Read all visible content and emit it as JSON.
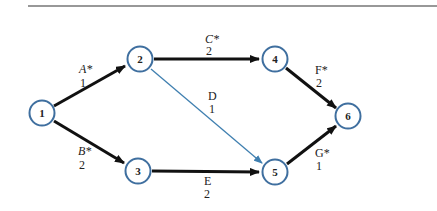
{
  "diagram": {
    "type": "activity-on-arc network",
    "colors": {
      "node_stroke": "#3f6f9f",
      "critical_arc": "#111111",
      "noncritical_arc": "#3f7fb0",
      "rule_line": "#333333"
    },
    "nodes": [
      {
        "id": "1",
        "label": "1"
      },
      {
        "id": "2",
        "label": "2"
      },
      {
        "id": "3",
        "label": "3"
      },
      {
        "id": "4",
        "label": "4"
      },
      {
        "id": "5",
        "label": "5"
      },
      {
        "id": "6",
        "label": "6"
      }
    ],
    "arcs": [
      {
        "activity": "A*",
        "duration": "1",
        "from": "1",
        "to": "2",
        "critical": true
      },
      {
        "activity": "B*",
        "duration": "2",
        "from": "1",
        "to": "3",
        "critical": true
      },
      {
        "activity": "C*",
        "duration": "2",
        "from": "2",
        "to": "4",
        "critical": true
      },
      {
        "activity": "D",
        "duration": "1",
        "from": "2",
        "to": "5",
        "critical": false
      },
      {
        "activity": "E",
        "duration": "2",
        "from": "3",
        "to": "5",
        "critical": true
      },
      {
        "activity": "F*",
        "duration": "2",
        "from": "4",
        "to": "6",
        "critical": true
      },
      {
        "activity": "G*",
        "duration": "1",
        "from": "5",
        "to": "6",
        "critical": true
      }
    ]
  }
}
